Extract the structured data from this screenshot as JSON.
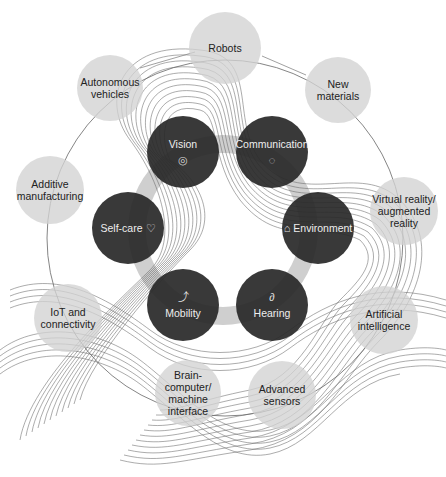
{
  "diagram": {
    "type": "ring diagram",
    "center": {
      "x": 223,
      "y": 230
    },
    "needs": [
      {
        "id": "vision",
        "label": "Vision",
        "icon": "eye-icon",
        "glyph": "◎",
        "x": 183,
        "y": 152,
        "r": 36
      },
      {
        "id": "communication",
        "label": "Communication",
        "icon": "speech-bubble-icon",
        "glyph": "◌",
        "x": 272,
        "y": 152,
        "r": 36
      },
      {
        "id": "environment",
        "label": "Environment",
        "icon": "home-icon",
        "glyph": "⌂",
        "x": 318,
        "y": 228,
        "r": 36
      },
      {
        "id": "hearing",
        "label": "Hearing",
        "icon": "ear-icon",
        "glyph": "∂",
        "x": 272,
        "y": 305,
        "r": 36
      },
      {
        "id": "mobility",
        "label": "Mobility",
        "icon": "stairs-arrow-icon",
        "glyph": "⤴",
        "x": 183,
        "y": 305,
        "r": 36
      },
      {
        "id": "selfcare",
        "label": "Self-care",
        "icon": "heart-icon",
        "glyph": "♡",
        "x": 128,
        "y": 228,
        "r": 36
      }
    ],
    "technologies": [
      {
        "id": "robots",
        "lines": [
          "Robots"
        ],
        "x": 225,
        "y": 48,
        "r": 36
      },
      {
        "id": "new-materials",
        "lines": [
          "New materials"
        ],
        "x": 338,
        "y": 90,
        "r": 33
      },
      {
        "id": "autonomous-vehicles",
        "lines": [
          "Autonomous",
          "vehicles"
        ],
        "x": 110,
        "y": 88,
        "r": 33
      },
      {
        "id": "additive-manufacturing",
        "lines": [
          "Additive",
          "manufacturing"
        ],
        "x": 50,
        "y": 190,
        "r": 34
      },
      {
        "id": "vr-ar",
        "lines": [
          "Virtual reality/",
          "augmented",
          "reality"
        ],
        "x": 404,
        "y": 211,
        "r": 34
      },
      {
        "id": "iot",
        "lines": [
          "IoT and",
          "connectivity"
        ],
        "x": 68,
        "y": 318,
        "r": 34
      },
      {
        "id": "ai",
        "lines": [
          "Artificial",
          "intelligence"
        ],
        "x": 384,
        "y": 320,
        "r": 34
      },
      {
        "id": "bci",
        "lines": [
          "Brain-",
          "computer/",
          "machine",
          "interface"
        ],
        "x": 188,
        "y": 393,
        "r": 33
      },
      {
        "id": "advanced-sensors",
        "lines": [
          "Advanced",
          "sensors"
        ],
        "x": 282,
        "y": 395,
        "r": 34
      }
    ]
  }
}
